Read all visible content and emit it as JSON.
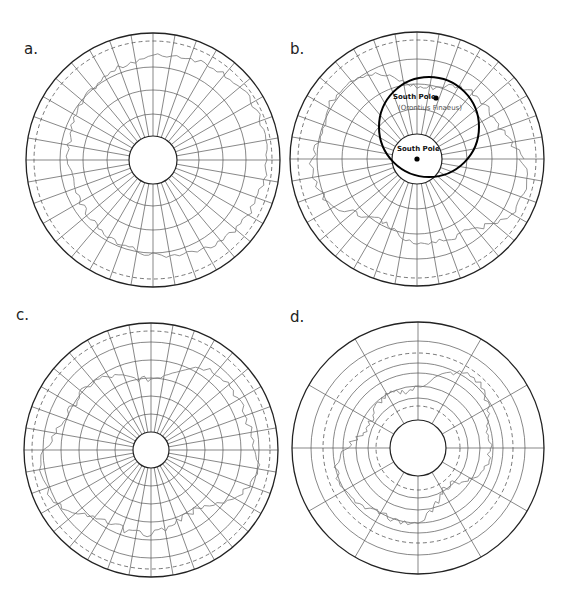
{
  "figure": {
    "panels": [
      {
        "id": "a",
        "label": "a.",
        "center": [
          153,
          160
        ],
        "outer_radius": 127,
        "inner_radius": 24,
        "dashed_radius": 119,
        "rings": [
          46,
          70,
          93
        ],
        "meridians": 36
      },
      {
        "id": "b",
        "label": "b.",
        "center": [
          417,
          159
        ],
        "outer_radius": 127,
        "inner_radius": 25,
        "dashed_radius": 119,
        "rings": [
          50,
          75,
          100
        ],
        "meridians": 36,
        "overlay_circle": {
          "center": [
            429,
            127
          ],
          "radius": 50
        },
        "annotations": [
          {
            "text": "South Pole",
            "x": 393,
            "y": 99,
            "bold": true
          },
          {
            "text": "(Orontius Finaeus)",
            "x": 398,
            "y": 110,
            "bold": false
          },
          {
            "text": "South Pole",
            "x": 397,
            "y": 151,
            "bold": true
          }
        ],
        "points": [
          {
            "x": 436,
            "y": 98
          },
          {
            "x": 417,
            "y": 159
          }
        ]
      },
      {
        "id": "c",
        "label": "c.",
        "center": [
          151,
          450
        ],
        "outer_radius": 127,
        "inner_radius": 18,
        "dashed_radius": 119,
        "rings": [
          36,
          54,
          72,
          90,
          108
        ],
        "meridians": 36
      },
      {
        "id": "d",
        "label": "d.",
        "center": [
          418,
          448
        ],
        "outer_radius": 126,
        "inner_radius": 28,
        "dashed_radius": [
          42,
          95
        ],
        "rings": [
          50,
          62,
          75,
          85,
          107
        ],
        "meridians": 12
      }
    ],
    "colors": {
      "grid": "#555555",
      "outline": "#222222",
      "coast": "#777777",
      "background": "#ffffff"
    }
  }
}
